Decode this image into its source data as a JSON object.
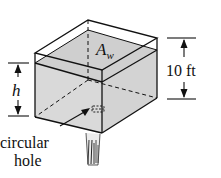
{
  "diagram": {
    "type": "tank-with-orifice",
    "labels": {
      "area": "A",
      "area_subscript": "w",
      "height_var": "h",
      "tank_height": "10 ft",
      "hole_line1": "circular",
      "hole_line2": "hole"
    },
    "colors": {
      "water": "#d9d9d9",
      "water_top": "#cfcfcf",
      "line": "#111111",
      "background": "#ffffff"
    }
  }
}
